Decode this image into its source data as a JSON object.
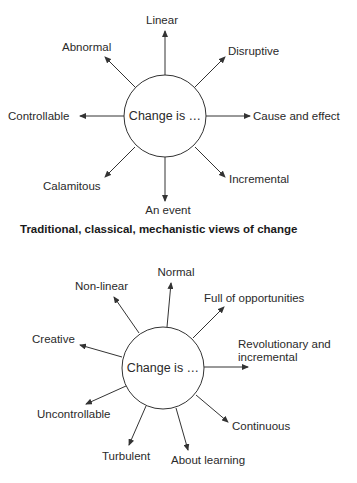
{
  "diagrams": [
    {
      "center_label": "Change is …",
      "caption": "Traditional, classical, mechanistic views of change",
      "spokes": [
        {
          "label": "Linear"
        },
        {
          "label": "Disruptive"
        },
        {
          "label": "Cause and effect"
        },
        {
          "label": "Incremental"
        },
        {
          "label": "An event"
        },
        {
          "label": "Calamitous"
        },
        {
          "label": "Controllable"
        },
        {
          "label": "Abnormal"
        }
      ]
    },
    {
      "center_label": "Change is …",
      "spokes": [
        {
          "label": "Normal"
        },
        {
          "label": "Full of opportunities"
        },
        {
          "label": "Revolutionary and",
          "label2": "incremental"
        },
        {
          "label": "Continuous"
        },
        {
          "label": "About learning"
        },
        {
          "label": "Turbulent"
        },
        {
          "label": "Uncontrollable"
        },
        {
          "label": "Creative"
        },
        {
          "label": "Non-linear"
        }
      ]
    }
  ]
}
